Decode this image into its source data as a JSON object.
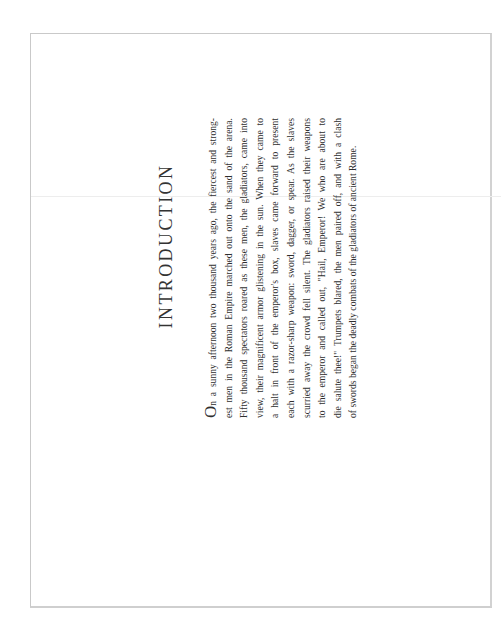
{
  "page": {
    "title": "INTRODUCTION",
    "drop_cap": "O",
    "lines": [
      "n a sunny afternoon two thousand years ago, the fiercest and strong-",
      "est men in the Roman Empire marched out onto the sand of the arena.",
      "Fifty thousand spectators roared as these men, the gladiators, came into",
      "view, their magnificent armor glistening in the sun. When they came to",
      "a halt in front of the emperor's box, slaves came forward to present",
      "each with a razor-sharp weapon: sword, dagger, or spear. As the slaves",
      "scurried away the crowd fell silent. The gladiators raised their weapons",
      "to the emperor and called out, \"Hail, Emperor! We who are about to",
      "die salute thee!\" Trumpets blared, the men paired off, and with a clash",
      "of swords began the deadly combats of the gladiators of ancient Rome."
    ],
    "orientation": "rotated 90° counter-clockwise"
  }
}
